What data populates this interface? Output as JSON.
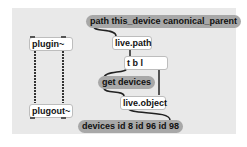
{
  "patch": {
    "messages": {
      "path_msg": "path this_device canonical_parent",
      "get_devices": "get devices",
      "devices_result": "devices id 8 id 96 id 98"
    },
    "objects": {
      "plugin": "plugin~",
      "plugout": "plugout~",
      "live_path": "live.path",
      "trigger": "t b l",
      "live_object": "live.object"
    },
    "colors": {
      "canvas": "#e9e9e9",
      "message_box": "#a8a8a8",
      "object_box": "#ffffff",
      "patch_cord": "#222222"
    }
  }
}
